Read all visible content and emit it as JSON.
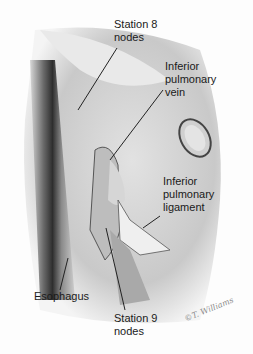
{
  "figure": {
    "labels": [
      {
        "id": "station8",
        "text": "Station 8\nnodes"
      },
      {
        "id": "ipv",
        "text": "Inferior\npulmonary\nvein"
      },
      {
        "id": "ipl",
        "text": "Inferior\npulmonary\nligament"
      },
      {
        "id": "esophagus",
        "text": "Esophagus"
      },
      {
        "id": "station9",
        "text": "Station 9\nnodes"
      }
    ],
    "signature": "©T. Williams"
  }
}
